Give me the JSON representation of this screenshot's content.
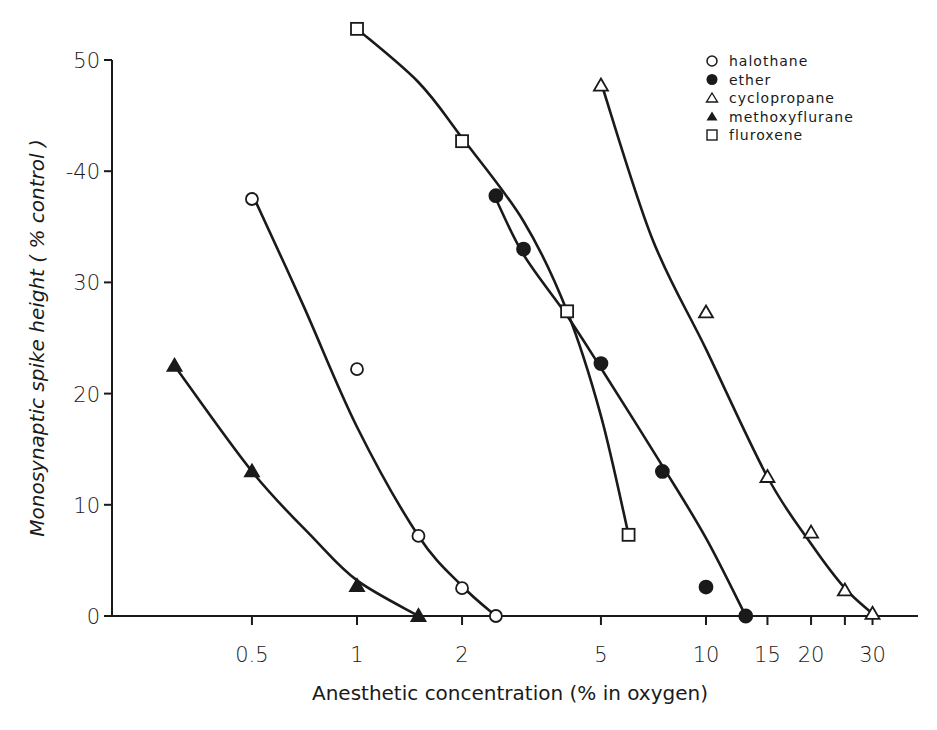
{
  "chart_data": {
    "type": "line",
    "title": "",
    "xlabel": "Anesthetic concentration (% in oxygen)",
    "ylabel": "Monosynaptic spike height ( % control )",
    "xscale": "log",
    "xlim": [
      0.2,
      45
    ],
    "ylim": [
      0,
      50
    ],
    "grid": false,
    "legend_position": "top-right",
    "x_ticks": [
      0.5,
      1,
      2,
      5,
      10,
      15,
      20,
      25,
      30
    ],
    "x_tick_labels": [
      "0.5",
      "1",
      "2",
      "5",
      "10",
      "15",
      "20",
      "",
      "30"
    ],
    "y_ticks": [
      0,
      10,
      20,
      30,
      40,
      50
    ],
    "y_tick_labels": [
      "0",
      "10",
      "20",
      "30",
      "-40",
      "50"
    ],
    "series": [
      {
        "name": "halothane",
        "marker": "open-circle",
        "x": [
          0.5,
          1,
          1.5,
          2,
          2.5
        ],
        "y": [
          37.5,
          22.2,
          7.2,
          2.5,
          0
        ],
        "curve_x": [
          0.5,
          0.7,
          1,
          1.5,
          2,
          2.5
        ],
        "curve_y": [
          38,
          28,
          17,
          7.2,
          2.7,
          0
        ]
      },
      {
        "name": "ether",
        "marker": "filled-circle",
        "x": [
          2.5,
          3,
          5,
          7.5,
          10,
          13
        ],
        "y": [
          37.8,
          33,
          22.7,
          13,
          2.6,
          0
        ],
        "curve_x": [
          2.5,
          3,
          4,
          5,
          7.5,
          10,
          13
        ],
        "curve_y": [
          37.5,
          32.5,
          27,
          22.3,
          13.5,
          7,
          0
        ]
      },
      {
        "name": "cyclopropane",
        "marker": "open-triangle",
        "x": [
          5,
          10,
          15,
          20,
          25,
          30
        ],
        "y": [
          47.7,
          27.3,
          12.5,
          7.5,
          2.3,
          0.2
        ],
        "curve_x": [
          5,
          7,
          10,
          15,
          20,
          25,
          30
        ],
        "curve_y": [
          48,
          34,
          24,
          12.5,
          6.5,
          2.5,
          0.2
        ]
      },
      {
        "name": "methoxyflurane",
        "marker": "filled-triangle",
        "x": [
          0.3,
          0.5,
          1,
          1.5
        ],
        "y": [
          22.5,
          13,
          2.7,
          0
        ],
        "curve_x": [
          0.3,
          0.5,
          0.75,
          1,
          1.5
        ],
        "curve_y": [
          22.5,
          13,
          7,
          3.2,
          0
        ]
      },
      {
        "name": "fluroxene",
        "marker": "open-square",
        "x": [
          1,
          2,
          4,
          6
        ],
        "y": [
          52.8,
          42.7,
          27.4,
          7.3
        ],
        "curve_x": [
          1,
          1.5,
          2,
          3,
          4,
          5,
          6
        ],
        "curve_y": [
          52.8,
          48,
          43,
          35.5,
          27.4,
          18,
          7.3
        ]
      }
    ]
  },
  "legend": {
    "items": [
      {
        "label": "halothane",
        "marker": "open-circle"
      },
      {
        "label": "ether",
        "marker": "filled-circle"
      },
      {
        "label": "cyclopropane",
        "marker": "open-triangle"
      },
      {
        "label": "methoxyflurane",
        "marker": "filled-triangle"
      },
      {
        "label": "fluroxene",
        "marker": "open-square"
      }
    ]
  },
  "axes": {
    "x_title": "Anesthetic concentration (% in oxygen)",
    "y_title": "Monosynaptic spike height ( % control )"
  },
  "colors": {
    "ink": "#1a1a1a",
    "background": "#ffffff"
  }
}
